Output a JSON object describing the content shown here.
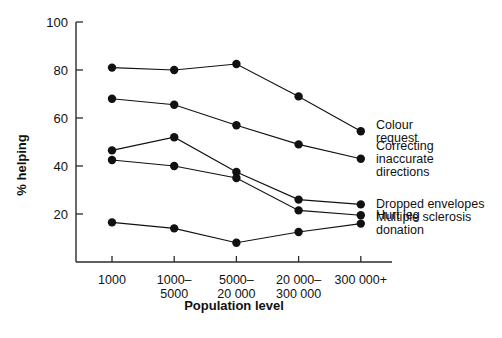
{
  "chart_data": {
    "type": "line",
    "title": "",
    "xlabel": "Population level",
    "ylabel": "% helping",
    "categories": [
      "1000",
      "1000–5000",
      "5000–20 000",
      "20 000–300 000",
      "300 000+"
    ],
    "category_lines": [
      [
        "1000"
      ],
      [
        "1000–",
        "5000"
      ],
      [
        "5000–",
        "20 000"
      ],
      [
        "20 000–",
        "300 000"
      ],
      [
        "300 000+"
      ]
    ],
    "ylim": [
      0,
      100
    ],
    "yticks": [
      20,
      40,
      60,
      80,
      100
    ],
    "ytick_labels": [
      "20",
      "40",
      "60",
      "80",
      "100"
    ],
    "grid": false,
    "legend_position": "right",
    "marker": "filled-circle",
    "line_color": "#111111",
    "marker_color": "#111111",
    "series": [
      {
        "name": "Colour request",
        "label_lines": [
          "Colour",
          "request"
        ],
        "values": [
          81,
          80,
          82.5,
          69,
          54.5
        ]
      },
      {
        "name": "Correcting inaccurate directions",
        "label_lines": [
          "Correcting",
          "inaccurate",
          "directions"
        ],
        "values": [
          68,
          65.5,
          57,
          49,
          43
        ]
      },
      {
        "name": "Dropped envelopes",
        "label_lines": [
          "Dropped envelopes"
        ],
        "values": [
          46.5,
          52,
          37.5,
          26,
          24
        ]
      },
      {
        "name": "Hurt leg",
        "label_lines": [
          "Hurt leg"
        ],
        "values": [
          42.5,
          40,
          35,
          21.5,
          19.5
        ]
      },
      {
        "name": "Multiple sclerosis donation",
        "label_lines": [
          "Multiple sclerosis",
          "donation"
        ],
        "values": [
          16.5,
          14,
          8,
          12.5,
          16
        ]
      }
    ]
  }
}
